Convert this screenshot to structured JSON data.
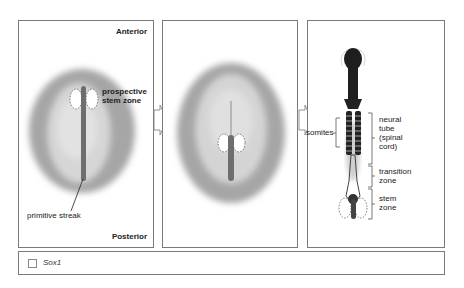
{
  "panels": [
    {
      "id": "stage-1",
      "labels": {
        "anterior": "Anterior",
        "posterior": "Posterior",
        "prospective_stem_zone": [
          "prospective",
          "stem zone"
        ],
        "primitive_streak": "primitive streak"
      }
    },
    {
      "id": "stage-2",
      "labels": {}
    },
    {
      "id": "stage-3",
      "labels": {
        "somites": "somites",
        "neural_tube": [
          "neural",
          "tube",
          "(spinal",
          "cord)"
        ],
        "transition_zone": [
          "transition",
          "zone"
        ],
        "stem_zone": [
          "stem",
          "zone"
        ]
      }
    }
  ],
  "legend": {
    "items": [
      {
        "label": "Sox1",
        "swatch_color": "#ffffff"
      }
    ]
  },
  "colors": {
    "embryo_outer": "#a6a6a6",
    "embryo_inner": "#d4d4d4",
    "streak": "#6e6e6e",
    "embryo_dark": "#1e1e1e",
    "border": "#7a7a7a"
  }
}
